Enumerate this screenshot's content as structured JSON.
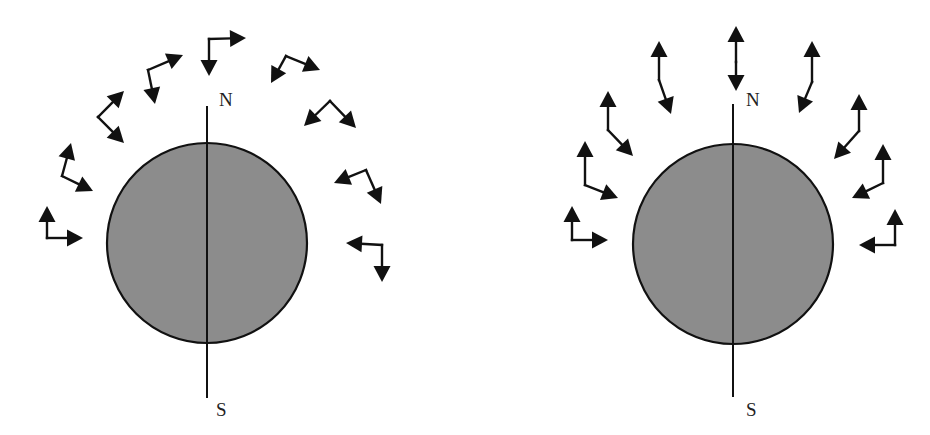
{
  "figure": {
    "colors": {
      "background": "#ffffff",
      "sphere_fill": "#8c8c8c",
      "stroke": "#111111",
      "label": "#222222"
    }
  },
  "panels": [
    {
      "id": "left",
      "sphere": {
        "cx": 207,
        "cy": 243,
        "r": 100
      },
      "axis": {
        "x": 207,
        "y1": 106,
        "y2": 398
      },
      "labels": {
        "north": {
          "text": "N",
          "x": 219,
          "y": 106
        },
        "south": {
          "text": "S",
          "x": 216,
          "y": 416
        }
      },
      "arrow_pairs": [
        {
          "corner": [
            47,
            238
          ],
          "heads": [
            [
              47,
              206
            ],
            [
              83,
              238
            ]
          ]
        },
        {
          "corner": [
            62,
            176
          ],
          "heads": [
            [
              71,
              143
            ],
            [
              93,
              191
            ]
          ]
        },
        {
          "corner": [
            98,
            117
          ],
          "heads": [
            [
              124,
              91
            ],
            [
              124,
              143
            ]
          ]
        },
        {
          "corner": [
            148,
            70
          ],
          "heads": [
            [
              183,
              55
            ],
            [
              155,
              104
            ]
          ]
        },
        {
          "corner": [
            209,
            39
          ],
          "heads": [
            [
              246,
              38
            ],
            [
              209,
              76
            ]
          ]
        },
        {
          "corner": [
            286,
            56
          ],
          "heads": [
            [
              271,
              83
            ],
            [
              320,
              70
            ]
          ]
        },
        {
          "corner": [
            330,
            101
          ],
          "heads": [
            [
              304,
              126
            ],
            [
              356,
              128
            ]
          ]
        },
        {
          "corner": [
            366,
            170
          ],
          "heads": [
            [
              334,
              183
            ],
            [
              381,
              204
            ]
          ]
        },
        {
          "corner": [
            382,
            245
          ],
          "heads": [
            [
              346,
              243
            ],
            [
              382,
              282
            ]
          ]
        }
      ]
    },
    {
      "id": "right",
      "sphere": {
        "cx": 733,
        "cy": 244,
        "r": 100
      },
      "axis": {
        "x": 733,
        "y1": 104,
        "y2": 397
      },
      "labels": {
        "north": {
          "text": "N",
          "x": 746,
          "y": 106
        },
        "south": {
          "text": "S",
          "x": 746,
          "y": 416
        }
      },
      "arrow_pairs": [
        {
          "corner": [
            572,
            240
          ],
          "heads": [
            [
              572,
              206
            ],
            [
              608,
              240
            ]
          ]
        },
        {
          "corner": [
            585,
            185
          ],
          "heads": [
            [
              585,
              141
            ],
            [
              618,
              198
            ]
          ]
        },
        {
          "corner": [
            608,
            130
          ],
          "heads": [
            [
              608,
              91
            ],
            [
              633,
              156
            ]
          ]
        },
        {
          "corner": [
            659,
            80
          ],
          "heads": [
            [
              659,
              41
            ],
            [
              671,
              114
            ]
          ]
        },
        {
          "corner": [
            736,
            62
          ],
          "heads": [
            [
              736,
              26
            ],
            [
              736,
              91
            ]
          ]
        },
        {
          "corner": [
            812,
            82
          ],
          "heads": [
            [
              812,
              41
            ],
            [
              799,
              113
            ]
          ]
        },
        {
          "corner": [
            859,
            131
          ],
          "heads": [
            [
              859,
              94
            ],
            [
              834,
              159
            ]
          ]
        },
        {
          "corner": [
            883,
            183
          ],
          "heads": [
            [
              883,
              144
            ],
            [
              852,
              198
            ]
          ]
        },
        {
          "corner": [
            895,
            245
          ],
          "heads": [
            [
              895,
              209
            ],
            [
              859,
              245
            ]
          ]
        }
      ]
    }
  ]
}
